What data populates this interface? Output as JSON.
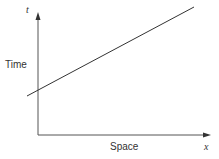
{
  "diagram": {
    "title": "",
    "y_axis": {
      "symbol": "t",
      "label": "Time"
    },
    "x_axis": {
      "symbol": "x",
      "label": "Space"
    },
    "line": {
      "description": "straight line with positive slope",
      "color": "#333333"
    }
  }
}
